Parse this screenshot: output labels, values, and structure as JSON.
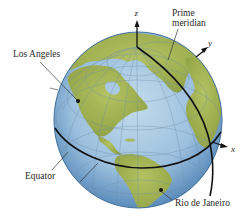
{
  "figure": {
    "type": "globe-diagram",
    "labels": {
      "los_angeles": "Los Angeles",
      "prime_meridian_line1": "Prime",
      "prime_meridian_line2": "meridian",
      "equator": "Equator",
      "rio": "Rio de Janeiro"
    },
    "axes": {
      "x": "x",
      "y": "y",
      "z": "z"
    },
    "colors": {
      "ocean_center": "#b9d4e8",
      "ocean_edge": "#4f82b4",
      "land": "#a9b858",
      "land_dark": "#8ea043",
      "gridline": "#6f8fa8",
      "equator_line": "#111111",
      "meridian_line": "#111111",
      "label_text": "#2a2a2a"
    },
    "points": [
      {
        "name": "Los Angeles",
        "x": 78,
        "y": 101
      },
      {
        "name": "Rio de Janeiro",
        "x": 161,
        "y": 190
      }
    ]
  }
}
